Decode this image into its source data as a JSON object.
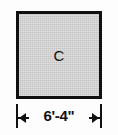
{
  "figure": {
    "type": "architectural-dimension-diagram",
    "background_color": "#fdfdfd",
    "shape": {
      "kind": "square",
      "label": "C",
      "fill_color": "#c4c4c4",
      "stroke_color": "#111111",
      "fill_pattern": "halftone-dither"
    },
    "dimension": {
      "text": "6'-4\"",
      "feet": "6",
      "inches": "4",
      "orientation": "horizontal",
      "position": "below",
      "arrow_style": "solid-triangle-outward",
      "line_color": "#111111"
    }
  }
}
